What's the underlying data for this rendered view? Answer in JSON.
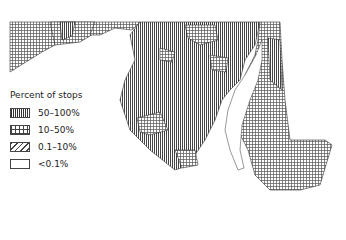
{
  "map": {
    "region": "Maryland counties/areas",
    "legend": {
      "title": "Percent of stops",
      "items": [
        {
          "label": "50–100%",
          "pattern": "vertical-lines"
        },
        {
          "label": "10–50%",
          "pattern": "grid"
        },
        {
          "label": "0.1–10%",
          "pattern": "diagonal-lines"
        },
        {
          "label": "<0.1%",
          "pattern": "blank"
        }
      ]
    },
    "colors": {
      "ink": "#333333",
      "background": "#ffffff"
    }
  }
}
